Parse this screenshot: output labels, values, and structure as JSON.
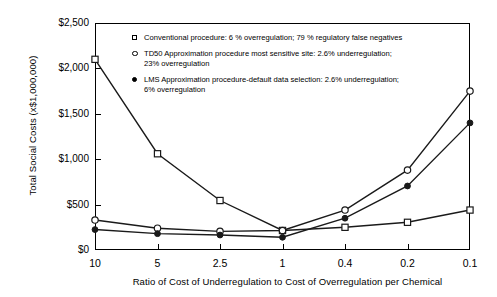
{
  "chart_data": {
    "type": "line",
    "title": "",
    "xlabel": "Ratio of Cost of Underregulation to Cost of Overregulation per Chemical",
    "ylabel": "Total Social Costs (x$1,000,000)",
    "categories": [
      "10",
      "5",
      "2.5",
      "1",
      "0.4",
      "0.2",
      "0.1"
    ],
    "ylim": [
      0,
      2500
    ],
    "ytick_labels": [
      "$0",
      "$500",
      "$1,000",
      "$1,500",
      "$2,000",
      "$2,500"
    ],
    "ytick_values": [
      0,
      500,
      1000,
      1500,
      2000,
      2500
    ],
    "grid": false,
    "legend_position": "upper-center-inside",
    "series": [
      {
        "name": "Conventional procedure",
        "marker": "open-square",
        "values": [
          2100,
          1060,
          545,
          215,
          250,
          305,
          440
        ]
      },
      {
        "name": "TD50 Approximation procedure most sensitive site",
        "marker": "open-circle",
        "values": [
          330,
          240,
          205,
          215,
          440,
          880,
          1750
        ]
      },
      {
        "name": "LMS Approximation procedure-default data selection",
        "marker": "filled-circle",
        "values": [
          225,
          180,
          165,
          140,
          350,
          705,
          1400
        ]
      }
    ]
  },
  "legend": {
    "items": [
      {
        "marker": "open-square",
        "line1": "Conventional procedure: 6 % overregulation; 79 % regulatory false negatives",
        "line2": ""
      },
      {
        "marker": "open-circle",
        "line1": "TD50 Approximation procedure most sensitive site: 2.6% underregulation;",
        "line2": "23% overregulation"
      },
      {
        "marker": "filled-circle",
        "line1": "LMS Approximation procedure-default data selection: 2.6% underregulation;",
        "line2": "6% overregulation"
      }
    ]
  },
  "colors": {
    "axis": "#000000",
    "line": "#1a1a1a",
    "background": "#ffffff"
  }
}
